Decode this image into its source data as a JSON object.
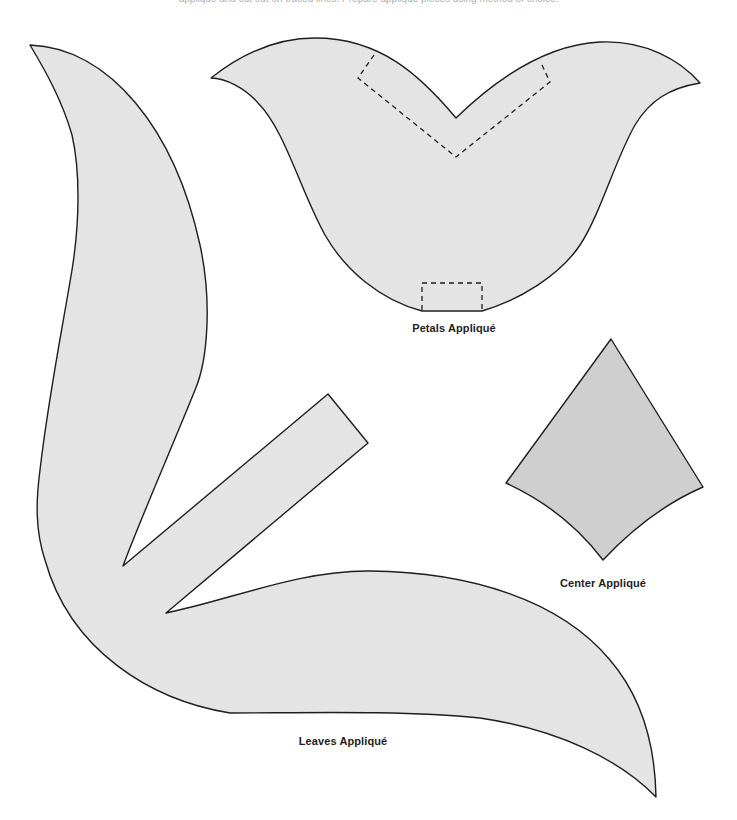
{
  "page": {
    "top_text_remnant": "appliqué and cut out on traced lines. Prepare appliqué pieces using method of choice."
  },
  "pieces": {
    "petals": {
      "label": "Petals Appliqué",
      "fill": "#e4e4e4"
    },
    "center": {
      "label": "Center Appliqué",
      "fill": "#cfcfcf"
    },
    "leaves": {
      "label": "Leaves Appliqué",
      "fill": "#e4e4e4"
    }
  },
  "colors": {
    "outline": "#1e1e1e",
    "background": "#ffffff"
  }
}
